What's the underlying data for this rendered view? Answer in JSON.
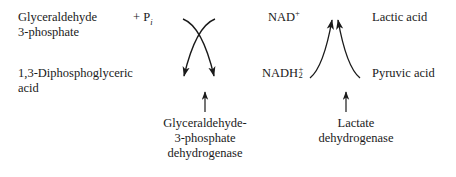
{
  "diagram": {
    "background_color": "#ffffff",
    "stroke_color": "#1a1a1a",
    "text_color": "#1a1a1a"
  },
  "left_reaction": {
    "substrate_line1": "Glyceraldehyde",
    "substrate_line2": "3-phosphate",
    "cosubstrate_plus": "+",
    "cosubstrate_symbol": "P",
    "cosubstrate_subscript": "i",
    "product_line1": "1,3-Diphosphoglyceric",
    "product_line2": "acid",
    "enzyme_line1": "Glyceraldehyde-",
    "enzyme_line2": "3-phosphate",
    "enzyme_line3": "dehydrogenase",
    "pointer": "up-arrow"
  },
  "right_reaction": {
    "cofactor_oxidized": "NAD",
    "cofactor_oxidized_superscript": "+",
    "cofactor_reduced": "NADH",
    "cofactor_reduced_superscript": "+",
    "cofactor_reduced_subscript": "2",
    "substrate": "Pyruvic acid",
    "product": "Lactic acid",
    "enzyme_line1": "Lactate",
    "enzyme_line2": "dehydrogenase",
    "pointer": "up-arrow"
  }
}
